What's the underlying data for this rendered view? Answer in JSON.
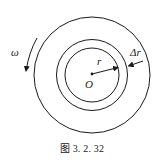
{
  "figure": {
    "caption": "图 3. 2. 32",
    "labels": {
      "omega": "ω",
      "radius": "r",
      "delta_radius": "Δr",
      "center": "O"
    },
    "geometry": {
      "center": [
        92,
        74
      ],
      "outer_radius": 58,
      "middle_radius": 36,
      "inner_radius": 27
    },
    "colors": {
      "stroke": "#1a1a1a",
      "background": "#ffffff"
    },
    "rotation_direction": "counterclockwise"
  }
}
